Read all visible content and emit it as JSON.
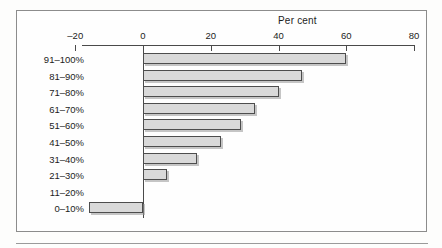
{
  "figure": {
    "title": "Per cent"
  },
  "chart_data": {
    "type": "bar",
    "orientation": "horizontal",
    "title": "Per cent",
    "xlabel": "Per cent",
    "ylabel": "",
    "xlim": [
      -20,
      80
    ],
    "xticks": [
      -20,
      0,
      20,
      40,
      60,
      80
    ],
    "xtick_labels": [
      "–20",
      "0",
      "20",
      "40",
      "60",
      "80"
    ],
    "grid": false,
    "legend": null,
    "categories": [
      "91–100%",
      "81–90%",
      "71–80%",
      "61–70%",
      "51–60%",
      "41–50%",
      "31–40%",
      "21–30%",
      "11–20%",
      "0–10%"
    ],
    "values": [
      60,
      47,
      40,
      33,
      29,
      23,
      16,
      7,
      0,
      -16
    ],
    "bar_fill_color": "#d9d9d9",
    "bar_edge_color": "#4d4d4d",
    "axis_color": "#4a4a4a",
    "frame_color": "#8c8c8c",
    "background_color": "#fefefe"
  }
}
